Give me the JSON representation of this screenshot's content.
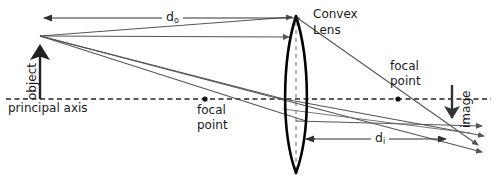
{
  "diagram": {
    "colors": {
      "ink": "#1a1a1a",
      "lens_outline": "#000000",
      "ray": "#555555",
      "axis": "#222222",
      "background": "#ffffff"
    },
    "labels": {
      "convex": "Convex",
      "lens": "Lens",
      "object": "object",
      "image": "image",
      "principal_axis": "principal axis",
      "focal_point_left_line1": "focal",
      "focal_point_left_line2": "point",
      "focal_point_right_line1": "focal",
      "focal_point_right_line2": "point",
      "distance_object": "d",
      "distance_object_sub": "o",
      "distance_image": "d",
      "distance_image_sub": "i"
    },
    "geometry": {
      "principal_axis_y": 99,
      "lens_center_x": 296,
      "lens_top_y": 16,
      "lens_bottom_y": 173,
      "lens_left_x": 283,
      "lens_right_x": 310,
      "object_x": 40,
      "object_tip_y": 36,
      "image_x": 452,
      "image_tip_y": 126,
      "focal_left_x": 205,
      "focal_right_x": 398,
      "do_arrow_y": 18,
      "do_arrow_x1": 38,
      "do_arrow_x2": 300,
      "di_arrow_y": 139,
      "di_arrow_x1": 305,
      "di_arrow_x2": 450
    }
  }
}
